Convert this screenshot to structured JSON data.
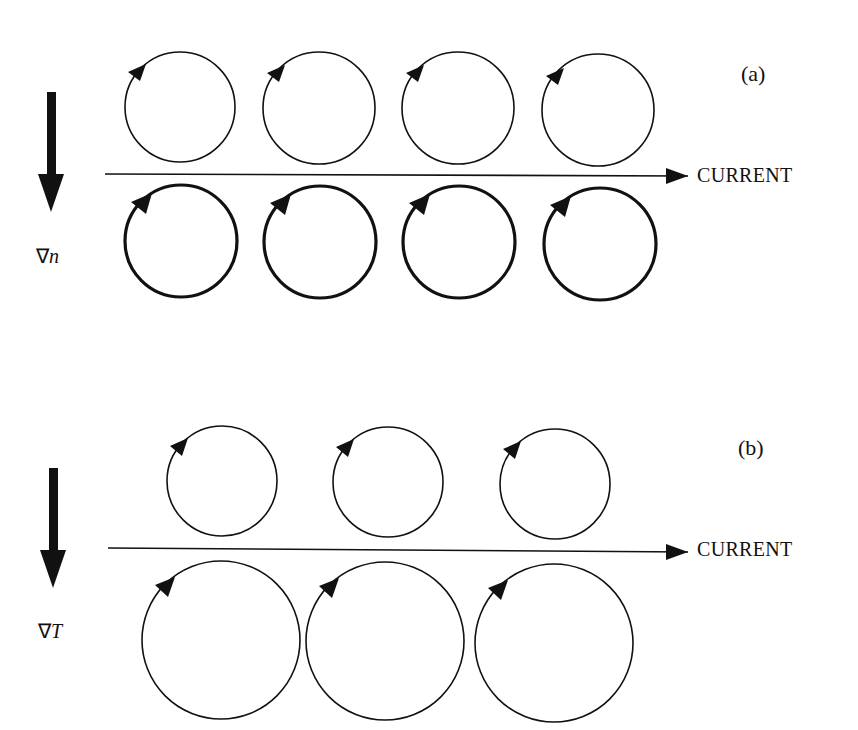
{
  "figure": {
    "panels": [
      {
        "id": "a",
        "label": "(a)",
        "gradient_symbol": "∇",
        "gradient_var": "n",
        "current_label": "CURRENT",
        "top_row": {
          "count": 4,
          "stroke": "thin"
        },
        "bottom_row": {
          "count": 4,
          "stroke": "thick"
        }
      },
      {
        "id": "b",
        "label": "(b)",
        "gradient_symbol": "∇",
        "gradient_var": "T",
        "current_label": "CURRENT",
        "top_row": {
          "count": 3,
          "size": "small"
        },
        "bottom_row": {
          "count": 3,
          "size": "large"
        }
      }
    ]
  },
  "colors": {
    "ink": "#111111",
    "background": "#ffffff"
  }
}
